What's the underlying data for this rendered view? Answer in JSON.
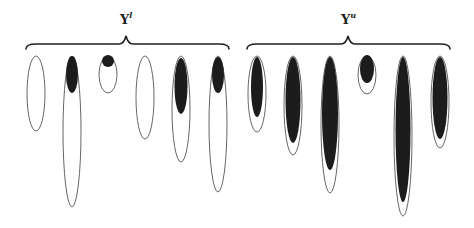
{
  "diagram": {
    "groups": [
      {
        "id": "lower",
        "label_base": "Y",
        "label_sup": "l",
        "brace": {
          "x1": 26,
          "x2": 229,
          "y": 44,
          "peak_x": 126
        },
        "ellipses": [
          {
            "cx": 36,
            "top": 56,
            "bottom": 131,
            "w": 18,
            "fill": null
          },
          {
            "cx": 72,
            "top": 56,
            "bottom": 207,
            "w": 18,
            "fill": {
              "top": 56,
              "bottom": 93,
              "w": 12
            }
          },
          {
            "cx": 108,
            "top": 56,
            "bottom": 93,
            "w": 18,
            "fill": {
              "top": 55,
              "bottom": 67,
              "w": 12
            }
          },
          {
            "cx": 145,
            "top": 56,
            "bottom": 139,
            "w": 18,
            "fill": null
          },
          {
            "cx": 181,
            "top": 56,
            "bottom": 162,
            "w": 18,
            "fill": {
              "top": 58,
              "bottom": 114,
              "w": 13
            }
          },
          {
            "cx": 218,
            "top": 56,
            "bottom": 192,
            "w": 18,
            "fill": {
              "top": 57,
              "bottom": 93,
              "w": 12
            }
          }
        ]
      },
      {
        "id": "upper",
        "label_base": "Y",
        "label_sup": "u",
        "brace": {
          "x1": 247,
          "x2": 450,
          "y": 44,
          "peak_x": 348
        },
        "ellipses": [
          {
            "cx": 257,
            "top": 56,
            "bottom": 132,
            "w": 18,
            "fill": {
              "top": 57,
              "bottom": 117,
              "w": 12
            }
          },
          {
            "cx": 293,
            "top": 56,
            "bottom": 155,
            "w": 18,
            "fill": {
              "top": 57,
              "bottom": 143,
              "w": 15
            }
          },
          {
            "cx": 330,
            "top": 56,
            "bottom": 193,
            "w": 18,
            "fill": {
              "top": 57,
              "bottom": 170,
              "w": 16
            }
          },
          {
            "cx": 367,
            "top": 56,
            "bottom": 94,
            "w": 18,
            "fill": {
              "top": 55,
              "bottom": 83,
              "w": 14
            }
          },
          {
            "cx": 403,
            "top": 56,
            "bottom": 216,
            "w": 18,
            "fill": {
              "top": 57,
              "bottom": 202,
              "w": 15
            }
          },
          {
            "cx": 440,
            "top": 56,
            "bottom": 148,
            "w": 18,
            "fill": {
              "top": 57,
              "bottom": 139,
              "w": 15
            }
          }
        ]
      }
    ],
    "colors": {
      "ink": "#1c1c1c",
      "outline": "#555555",
      "background": "#ffffff"
    }
  }
}
